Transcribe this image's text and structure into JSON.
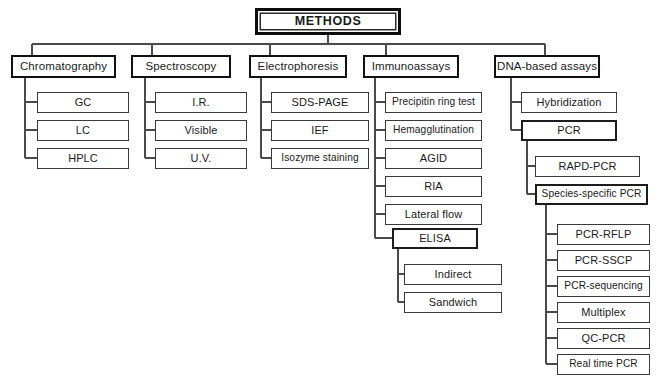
{
  "diagram": {
    "title": "METHODS",
    "type": "hierarchical tree / organizational chart",
    "root": {
      "label": "METHODS",
      "x": 255,
      "y": 8,
      "w": 146,
      "h": 27
    },
    "branches": [
      {
        "label": "Chromatography",
        "x": 11,
        "y": 55,
        "w": 105,
        "h": 23,
        "children": [
          {
            "label": "GC",
            "x": 37,
            "y": 92,
            "w": 92,
            "h": 21
          },
          {
            "label": "LC",
            "x": 37,
            "y": 120,
            "w": 92,
            "h": 21
          },
          {
            "label": "HPLC",
            "x": 37,
            "y": 148,
            "w": 92,
            "h": 21
          }
        ]
      },
      {
        "label": "Spectroscopy",
        "x": 131,
        "y": 55,
        "w": 100,
        "h": 23,
        "children": [
          {
            "label": "I.R.",
            "x": 155,
            "y": 92,
            "w": 92,
            "h": 21
          },
          {
            "label": "Visible",
            "x": 155,
            "y": 120,
            "w": 92,
            "h": 21
          },
          {
            "label": "U.V.",
            "x": 155,
            "y": 148,
            "w": 92,
            "h": 21
          }
        ]
      },
      {
        "label": "Electrophoresis",
        "x": 249,
        "y": 55,
        "w": 98,
        "h": 23,
        "children": [
          {
            "label": "SDS-PAGE",
            "x": 271,
            "y": 92,
            "w": 98,
            "h": 21
          },
          {
            "label": "IEF",
            "x": 271,
            "y": 120,
            "w": 98,
            "h": 21
          },
          {
            "label": "Isozyme staining",
            "x": 271,
            "y": 148,
            "w": 98,
            "h": 21
          }
        ]
      },
      {
        "label": "Immunoassays",
        "x": 363,
        "y": 55,
        "w": 96,
        "h": 23,
        "children": [
          {
            "label": "Precipitin ring test",
            "x": 385,
            "y": 92,
            "w": 97,
            "h": 21
          },
          {
            "label": "Hemagglutination",
            "x": 385,
            "y": 120,
            "w": 97,
            "h": 21
          },
          {
            "label": "AGID",
            "x": 385,
            "y": 148,
            "w": 97,
            "h": 21
          },
          {
            "label": "RIA",
            "x": 385,
            "y": 176,
            "w": 97,
            "h": 21
          },
          {
            "label": "Lateral flow",
            "x": 385,
            "y": 204,
            "w": 97,
            "h": 21
          },
          {
            "label": "ELISA",
            "x": 392,
            "y": 228,
            "w": 86,
            "h": 21,
            "children": [
              {
                "label": "Indirect",
                "x": 404,
                "y": 264,
                "w": 98,
                "h": 21
              },
              {
                "label": "Sandwich",
                "x": 404,
                "y": 292,
                "w": 98,
                "h": 21
              }
            ]
          }
        ]
      },
      {
        "label": "DNA-based assays",
        "x": 494,
        "y": 55,
        "w": 106,
        "h": 23,
        "children": [
          {
            "label": "Hybridization",
            "x": 521,
            "y": 92,
            "w": 96,
            "h": 21
          },
          {
            "label": "PCR",
            "x": 521,
            "y": 120,
            "w": 96,
            "h": 21,
            "children": [
              {
                "label": "RAPD-PCR",
                "x": 535,
                "y": 156,
                "w": 105,
                "h": 21
              },
              {
                "label": "Species-specific PCR",
                "x": 535,
                "y": 184,
                "w": 113,
                "h": 21,
                "children": [
                  {
                    "label": "PCR-RFLP",
                    "x": 557,
                    "y": 224,
                    "w": 93,
                    "h": 21
                  },
                  {
                    "label": "PCR-SSCP",
                    "x": 557,
                    "y": 250,
                    "w": 93,
                    "h": 21
                  },
                  {
                    "label": "PCR-sequencing",
                    "x": 557,
                    "y": 276,
                    "w": 93,
                    "h": 21
                  },
                  {
                    "label": "Multiplex",
                    "x": 557,
                    "y": 302,
                    "w": 93,
                    "h": 21
                  },
                  {
                    "label": "QC-PCR",
                    "x": 557,
                    "y": 328,
                    "w": 93,
                    "h": 21
                  },
                  {
                    "label": "Real time PCR",
                    "x": 557,
                    "y": 354,
                    "w": 93,
                    "h": 21
                  }
                ]
              }
            ]
          }
        ]
      }
    ],
    "colors": {
      "background": "#ffffff",
      "line": "#4a4a4a",
      "root_border": "#0d0d0d",
      "level2_border": "#111111",
      "leaf_border": "#3a3a3a",
      "text": "#1a1a1a"
    }
  }
}
